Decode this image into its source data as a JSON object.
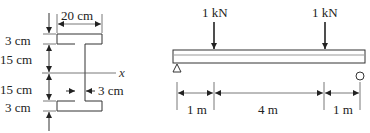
{
  "cross_section": {
    "title": "I-beam cross-section",
    "flange_width_label": "20 cm",
    "top_flange_thickness_label": "3 cm",
    "upper_web_height_label": "15 cm",
    "lower_web_height_label": "15 cm",
    "bottom_flange_thickness_label": "3 cm",
    "web_thickness_label": "3 cm",
    "neutral_axis_label": "x"
  },
  "beam": {
    "title": "Simply supported beam",
    "loads": [
      {
        "label": "1 kN",
        "position_m": 1
      },
      {
        "label": "1 kN",
        "position_m": 5
      }
    ],
    "supports": [
      {
        "type": "pin",
        "icon": "triangle-support-icon",
        "position_m": 0
      },
      {
        "type": "roller",
        "icon": "circle-roller-icon",
        "position_m": 6
      }
    ],
    "spans": [
      {
        "label": "1 m"
      },
      {
        "label": "4 m"
      },
      {
        "label": "1 m"
      }
    ]
  }
}
